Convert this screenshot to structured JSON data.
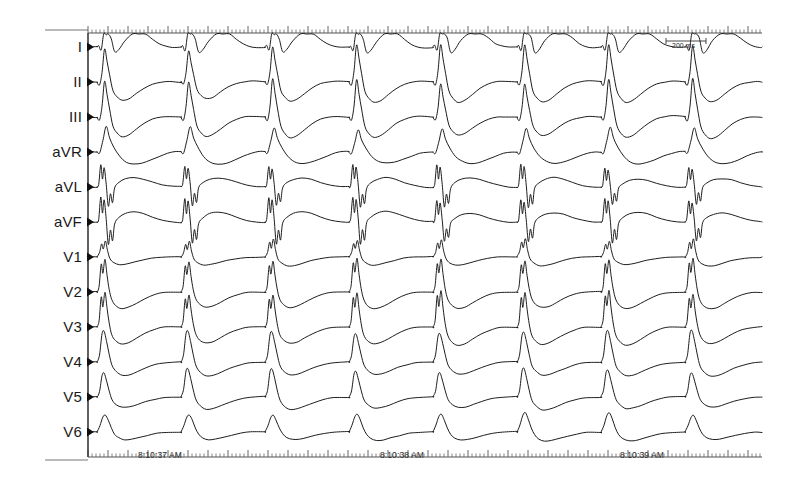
{
  "chart_data": {
    "type": "line",
    "xlabel": "Time",
    "ylabel": "Leads",
    "grid": false,
    "legend_position": "left",
    "paper_speed_note": "200 ms",
    "x_axis": {
      "ruler_top": true,
      "ruler_bottom": true,
      "minor_tick_spacing_px": 4,
      "major_tick_spacing_px": 20,
      "tick_labels": [
        "8:10:37 AM",
        "8:10:38 AM",
        "8:10:39 AM"
      ],
      "tick_label_x_px": [
        168,
        410,
        650
      ]
    },
    "axis_origin_x_px": 88,
    "axis_end_x_px": 762,
    "beats": 8,
    "beat_period_px": 84,
    "first_beat_x_px": 97,
    "series": [
      {
        "name": "I",
        "baseline_y_px": 47,
        "row_height_px": 35,
        "morphology": "broad-qrs-positive-notched",
        "amplitude_px": 28,
        "t_wave_amplitude_px": 14,
        "t_wave_direction": "positive"
      },
      {
        "name": "II",
        "baseline_y_px": 82,
        "row_height_px": 35,
        "morphology": "tall-peaked-qrs",
        "amplitude_px": 34,
        "t_wave_amplitude_px": 12,
        "t_wave_direction": "negative"
      },
      {
        "name": "III",
        "baseline_y_px": 117,
        "row_height_px": 35,
        "morphology": "tall-peaked-qrs",
        "amplitude_px": 36,
        "t_wave_amplitude_px": 12,
        "t_wave_direction": "negative"
      },
      {
        "name": "aVR",
        "baseline_y_px": 152,
        "row_height_px": 35,
        "morphology": "deep-negative-qrs",
        "amplitude_px": -24,
        "t_wave_amplitude_px": 10,
        "t_wave_direction": "positive"
      },
      {
        "name": "aVL",
        "baseline_y_px": 187,
        "row_height_px": 35,
        "morphology": "narrow-biphasic",
        "amplitude_px": 22,
        "t_wave_amplitude_px": 8,
        "t_wave_direction": "positive"
      },
      {
        "name": "aVF",
        "baseline_y_px": 222,
        "row_height_px": 35,
        "morphology": "narrow-biphasic",
        "amplitude_px": 24,
        "t_wave_amplitude_px": 8,
        "t_wave_direction": "positive"
      },
      {
        "name": "V1",
        "baseline_y_px": 257,
        "row_height_px": 35,
        "morphology": "rsr-notched",
        "amplitude_px": 20,
        "t_wave_amplitude_px": 10,
        "t_wave_direction": "negative"
      },
      {
        "name": "V2",
        "baseline_y_px": 292,
        "row_height_px": 35,
        "morphology": "tall-notched-r",
        "amplitude_px": 32,
        "t_wave_amplitude_px": 12,
        "t_wave_direction": "negative"
      },
      {
        "name": "V3",
        "baseline_y_px": 327,
        "row_height_px": 35,
        "morphology": "tall-notched-r",
        "amplitude_px": 34,
        "t_wave_amplitude_px": 12,
        "t_wave_direction": "negative"
      },
      {
        "name": "V4",
        "baseline_y_px": 362,
        "row_height_px": 35,
        "morphology": "tall-r-slurred",
        "amplitude_px": 30,
        "t_wave_amplitude_px": 11,
        "t_wave_direction": "negative"
      },
      {
        "name": "V5",
        "baseline_y_px": 397,
        "row_height_px": 35,
        "morphology": "tall-r-slurred",
        "amplitude_px": 26,
        "t_wave_amplitude_px": 10,
        "t_wave_direction": "negative"
      },
      {
        "name": "V6",
        "baseline_y_px": 432,
        "row_height_px": 35,
        "morphology": "rounded-r-wide",
        "amplitude_px": 20,
        "t_wave_amplitude_px": 9,
        "t_wave_direction": "negative"
      }
    ]
  },
  "leads": [
    {
      "label": "I",
      "y": 47
    },
    {
      "label": "II",
      "y": 82
    },
    {
      "label": "III",
      "y": 117
    },
    {
      "label": "aVR",
      "y": 152
    },
    {
      "label": "aVL",
      "y": 187
    },
    {
      "label": "aVF",
      "y": 222
    },
    {
      "label": "V1",
      "y": 257
    },
    {
      "label": "V2",
      "y": 292
    },
    {
      "label": "V3",
      "y": 327
    },
    {
      "label": "V4",
      "y": 362
    },
    {
      "label": "V5",
      "y": 397
    },
    {
      "label": "V6",
      "y": 432
    }
  ],
  "timestamps": [
    {
      "text": "8:10:37 AM",
      "x": 138
    },
    {
      "text": "8:10:38 AM",
      "x": 380
    },
    {
      "text": "8:10:39 AM",
      "x": 620
    }
  ],
  "scale_bar": {
    "text": "200 ms",
    "x": 666,
    "y": 38,
    "width": 40
  },
  "colors": {
    "trace": "#111111",
    "axis": "#555555",
    "border": "#777777",
    "background": "#ffffff",
    "label_text": "#1a1a1a",
    "tick_text": "#2b2b2b"
  }
}
